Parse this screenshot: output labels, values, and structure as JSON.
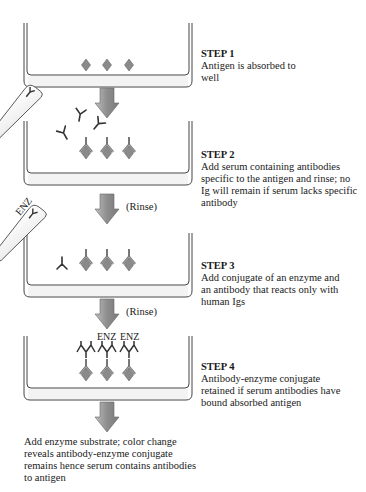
{
  "steps": [
    {
      "title": "STEP 1",
      "description": "Antigen is absorbed to well"
    },
    {
      "title": "STEP 2",
      "description": "Add serum containing antibodies specific to the antigen and rinse; no Ig will remain if serum lacks specific antibody"
    },
    {
      "title": "STEP 3",
      "description": "Add conjugate of an enzyme and an antibody that reacts only with human Igs"
    },
    {
      "title": "STEP 4",
      "description": "Antibody-enzyme conjugate retained if serum antibodies have bound absorbed antigen"
    }
  ],
  "rinse_labels": [
    "(Rinse)",
    "(Rinse)"
  ],
  "enzyme_label": "ENZ",
  "final_text": "Add enzyme substrate; color change reveals antibody-enzyme conjugate remains hence serum contains antibodies to antigen",
  "colors": {
    "antigen": "#8a8a8a",
    "arrow": "#9a9a9a",
    "line": "#555555"
  }
}
